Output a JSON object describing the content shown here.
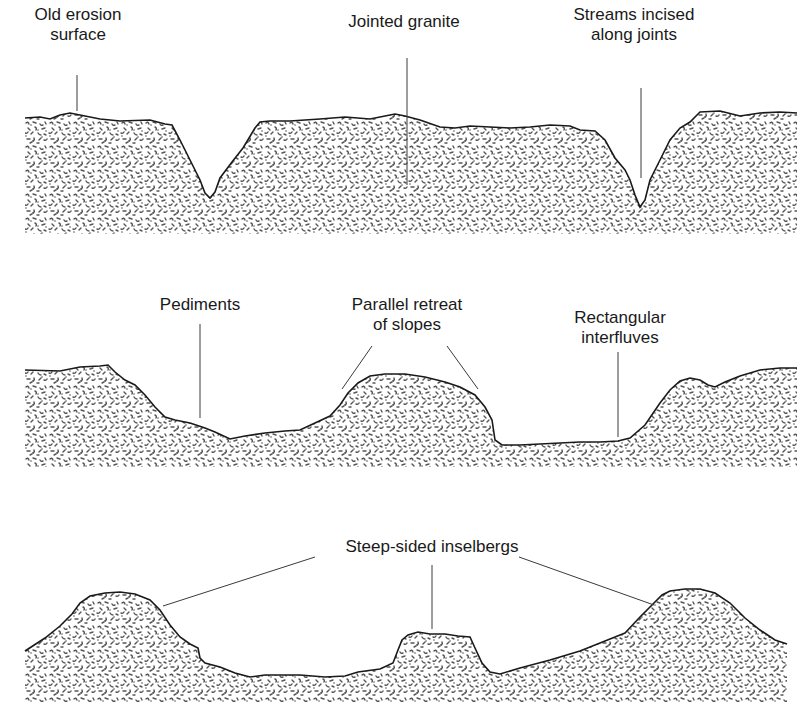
{
  "diagram": {
    "colors": {
      "background": "#ffffff",
      "outline": "#1a1a1a",
      "leader": "#3a3a3a",
      "granite_speckle": "#555555",
      "text": "#1a1a1a"
    },
    "stages": [
      {
        "id": "stage-1",
        "labels": [
          {
            "lines": [
              "Old erosion",
              "surface"
            ],
            "x": 78,
            "y": 5
          },
          {
            "lines": [
              "Jointed granite"
            ],
            "x": 404,
            "y": 12
          },
          {
            "lines": [
              "Streams incised",
              "along joints"
            ],
            "x": 634,
            "y": 5
          }
        ],
        "outline": "M25,118 L40,117 L50,119 L60,115 L70,113 L80,115 L100,119 L120,121 L150,120 L165,124 L172,125 L180,140 L190,160 L200,180 L205,193 L210,198 L215,192 L220,178 L232,162 L243,148 L255,128 L260,122 L270,121 L290,121 L320,119 L345,117 L370,119 L380,117 L395,114 L405,116 L420,120 L440,127 L455,128 L470,126 L490,127 L510,128 L530,127 L550,125 L570,126 L580,130 L595,131 L605,140 L615,158 L625,170 L630,180 L635,195 L640,207 L645,200 L650,180 L660,160 L670,140 L680,128 L690,122 L700,112 L720,111 L740,116 L760,113 L780,112 L797,113 L797,234 L25,234 Z",
        "leaders": [
          {
            "x1": 77,
            "y1": 75,
            "x2": 77,
            "y2": 111
          },
          {
            "x1": 407,
            "y1": 58,
            "x2": 407,
            "y2": 185
          },
          {
            "x1": 641,
            "y1": 88,
            "x2": 641,
            "y2": 178
          }
        ]
      },
      {
        "id": "stage-2",
        "labels": [
          {
            "lines": [
              "Pediments"
            ],
            "x": 200,
            "y": 295
          },
          {
            "lines": [
              "Parallel retreat",
              "of slopes"
            ],
            "x": 407,
            "y": 295
          },
          {
            "lines": [
              "Rectangular",
              "interfluves"
            ],
            "x": 620,
            "y": 308
          }
        ],
        "outline": "M25,370 L60,371 L80,367 L100,366 L108,365 L115,372 L125,380 L135,385 L145,395 L155,407 L165,417 L175,420 L190,423 L205,428 L215,432 L230,439 L245,436 L265,433 L285,431 L300,430 L315,423 L330,416 L340,405 L348,393 L358,383 L370,376 L385,374 L405,374 L425,377 L445,382 L460,387 L475,395 L485,407 L492,420 L495,440 L502,445 L520,445 L540,444 L560,443 L580,442 L600,442 L618,441 L630,438 L645,425 L660,403 L670,390 L680,381 L690,378 L700,380 L708,385 L715,387 L725,382 L740,376 L760,370 L780,368 L797,368 L797,467 L25,467 Z",
        "leaders": [
          {
            "x1": 200,
            "y1": 324,
            "x2": 200,
            "y2": 418
          },
          {
            "x1": 372,
            "y1": 346,
            "x2": 342,
            "y2": 389
          },
          {
            "x1": 447,
            "y1": 346,
            "x2": 478,
            "y2": 389
          },
          {
            "x1": 618,
            "y1": 352,
            "x2": 618,
            "y2": 437
          }
        ]
      },
      {
        "id": "stage-3",
        "labels": [
          {
            "lines": [
              "Steep-sided inselbergs"
            ],
            "x": 432,
            "y": 537
          }
        ],
        "outline": "M25,651 L45,638 L60,626 L72,614 L80,603 L90,596 L105,593 L120,592 L135,594 L150,600 L160,610 L170,625 L180,637 L190,644 L198,648 L200,658 L205,663 L220,667 L235,673 L250,677 L265,675 L280,675 L300,675 L325,677 L345,676 L358,672 L380,669 L393,663 L398,650 L402,640 L408,635 L418,632 L430,634 L445,634 L458,636 L470,637 L475,648 L482,663 L490,672 L500,674 L520,668 L550,660 L580,651 L605,641 L625,633 L640,617 L652,605 L662,595 L670,591 L685,589 L700,589 L715,593 L730,603 L745,618 L760,630 L775,640 L787,644 L787,702 L25,702 Z",
        "leaders": [
          {
            "x1": 315,
            "y1": 557,
            "x2": 163,
            "y2": 606
          },
          {
            "x1": 432,
            "y1": 565,
            "x2": 432,
            "y2": 629
          },
          {
            "x1": 519,
            "y1": 557,
            "x2": 654,
            "y2": 605
          }
        ]
      }
    ]
  }
}
